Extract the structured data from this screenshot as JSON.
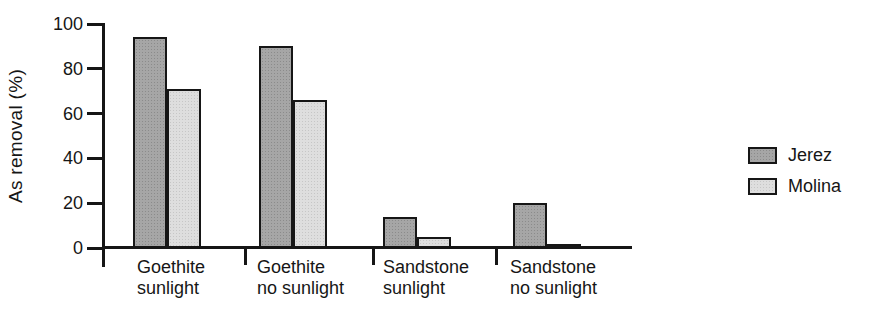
{
  "figure": {
    "background": "#ffffff",
    "axis_color": "#161616"
  },
  "chart_data": {
    "type": "bar",
    "title": "",
    "xlabel": "",
    "ylabel": "As removal (%)",
    "ylim": [
      0,
      100
    ],
    "yticks": [
      0,
      20,
      40,
      60,
      80,
      100
    ],
    "grid": false,
    "legend_position": "right",
    "categories": [
      "Goethite\nsunlight",
      "Goethite\nno sunlight",
      "Sandstone\nsunlight",
      "Sandstone\nno sunlight"
    ],
    "series": [
      {
        "name": "Jerez",
        "color": "#a6a6a6",
        "values": [
          94,
          90,
          14,
          20
        ]
      },
      {
        "name": "Molina",
        "color": "#dedede",
        "values": [
          71,
          66,
          5,
          2
        ]
      }
    ]
  }
}
